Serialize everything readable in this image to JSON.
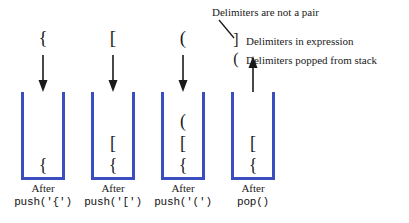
{
  "diagram": {
    "accent_color": "#3b4ec0",
    "ink_color": "#1a1a1a",
    "background": "#ffffff"
  },
  "columns": [
    {
      "id": "col-1",
      "top_delimiter": "{",
      "arrow": "down",
      "stack_items": [
        "{"
      ],
      "caption_after": "After",
      "caption_code": "push('{')"
    },
    {
      "id": "col-2",
      "top_delimiter": "[",
      "arrow": "down",
      "stack_items": [
        "[",
        "{"
      ],
      "caption_after": "After",
      "caption_code": "push('[')"
    },
    {
      "id": "col-3",
      "top_delimiter": "(",
      "arrow": "down",
      "stack_items": [
        "(",
        "[",
        "{"
      ],
      "caption_after": "After",
      "caption_code": "push('(')"
    },
    {
      "id": "col-4",
      "top_delimiter": "",
      "arrow": "up",
      "stack_items": [
        "[",
        "{"
      ],
      "caption_after": "After",
      "caption_code": "pop()"
    }
  ],
  "legend": {
    "title": "Delimiters are not a pair",
    "entries": [
      {
        "glyph": "]",
        "label": "Delimiters in expression"
      },
      {
        "glyph": "(",
        "label": "Delimiters popped from stack"
      }
    ]
  }
}
